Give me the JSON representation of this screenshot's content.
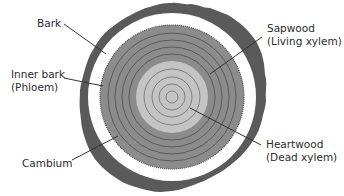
{
  "diagram": {
    "labels": {
      "bark": "Bark",
      "inner_bark_line1": "Inner bark",
      "inner_bark_line2": "(Phloem)",
      "cambium": "Cambium",
      "sapwood_line1": "Sapwood",
      "sapwood_line2": "(Living xylem)",
      "heartwood_line1": "Heartwood",
      "heartwood_line2": "(Dead xylem)"
    },
    "colors": {
      "bark": "#5a5a5a",
      "inner_bark": "#ffffff",
      "sapwood": "#8c8c8c",
      "heartwood": "#c4c4c4",
      "ring_line": "#555555",
      "leader_line": "#333333"
    }
  }
}
